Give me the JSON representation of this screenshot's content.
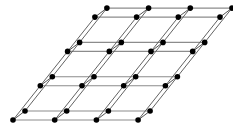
{
  "figure": {
    "background_color": "#ffffff",
    "width": 233,
    "height": 138
  },
  "chart_data": {
    "type": "scatter",
    "xlabel": "",
    "ylabel": "",
    "grid": true,
    "legend": "none",
    "xlim": [
      0,
      233
    ],
    "ylim": [
      0,
      138
    ],
    "projection": {
      "origin": [
        13.0,
        120.0
      ],
      "vector_a": [
        41.7,
        0.0
      ],
      "vector_b": [
        27.3,
        -34.3
      ],
      "vector_c": [
        12.0,
        -9.0
      ]
    },
    "counts": {
      "nodes_per_row": 4,
      "rows_per_layer": 4,
      "layers": 2,
      "total_nodes": 32
    },
    "node_style": {
      "color": "#000000",
      "radius": 2.8,
      "shape": "circle"
    },
    "edge_styles": {
      "horizontal_color": "#8c8c8c",
      "depth_color": "#5a5a5a",
      "vertical_color": "#4a4a4a",
      "horizontal_width": 1.15,
      "depth_width": 0.95,
      "vertical_width": 0.95
    },
    "layer_nodes": [
      {
        "layer": 0,
        "points": [
          [
            13.0,
            120.0
          ],
          [
            54.7,
            120.0
          ],
          [
            96.4,
            120.0
          ],
          [
            138.1,
            120.0
          ],
          [
            40.3,
            85.7
          ],
          [
            82.0,
            85.7
          ],
          [
            123.7,
            85.7
          ],
          [
            165.4,
            85.7
          ],
          [
            67.6,
            51.4
          ],
          [
            109.3,
            51.4
          ],
          [
            151.0,
            51.4
          ],
          [
            192.7,
            51.4
          ],
          [
            94.9,
            17.1
          ],
          [
            136.6,
            17.1
          ],
          [
            178.3,
            17.1
          ],
          [
            220.0,
            17.1
          ]
        ]
      },
      {
        "layer": 1,
        "points": [
          [
            25.0,
            111.0
          ],
          [
            66.7,
            111.0
          ],
          [
            108.4,
            111.0
          ],
          [
            150.1,
            111.0
          ],
          [
            52.3,
            76.7
          ],
          [
            94.0,
            76.7
          ],
          [
            135.7,
            76.7
          ],
          [
            177.4,
            76.7
          ],
          [
            79.6,
            42.4
          ],
          [
            121.3,
            42.4
          ],
          [
            163.0,
            42.4
          ],
          [
            204.7,
            42.4
          ],
          [
            106.9,
            8.1
          ],
          [
            148.6,
            8.1
          ],
          [
            190.3,
            8.1
          ],
          [
            232.0,
            8.1
          ]
        ]
      }
    ]
  }
}
